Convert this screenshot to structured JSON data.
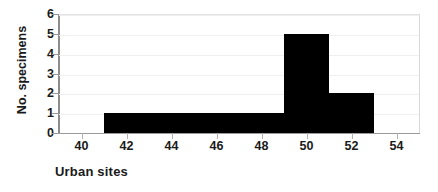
{
  "chart_data": {
    "type": "bar",
    "title": "",
    "subtitle": "",
    "xlabel": "Urban sites",
    "ylabel": "No. specimens",
    "xlim": [
      39,
      55
    ],
    "ylim": [
      0,
      6
    ],
    "xticks": [
      40,
      42,
      44,
      46,
      48,
      50,
      52,
      54
    ],
    "xtick_labels": [
      "40",
      "42",
      "44",
      "46",
      "48",
      "50",
      "52",
      "54"
    ],
    "yticks": [
      0,
      1,
      2,
      3,
      4,
      5,
      6
    ],
    "ytick_labels": [
      "0",
      "1",
      "2",
      "3",
      "4",
      "5",
      "6"
    ],
    "grid": true,
    "legend": null,
    "bar_color": "#000000",
    "histogram_style": true,
    "bins": [
      {
        "x_start": 41,
        "x_end": 49,
        "value": 1
      },
      {
        "x_start": 49,
        "x_end": 51,
        "value": 5
      },
      {
        "x_start": 51,
        "x_end": 53,
        "value": 2
      }
    ],
    "categories": [
      "41-49",
      "49-51",
      "51-53"
    ],
    "values": [
      1,
      5,
      2
    ]
  },
  "axes": {
    "y_title": "No. specimens",
    "x_title": "Urban sites"
  }
}
